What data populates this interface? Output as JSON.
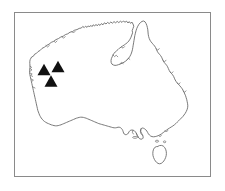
{
  "figure": {
    "kind": "distribution-map",
    "region_label": "Australia",
    "background_color": "#ffffff"
  },
  "frame": {
    "name": "map-border",
    "x": 14,
    "y": 12,
    "width": 196,
    "height": 164,
    "stroke_color": "#8a8a8a",
    "stroke_width": 1
  },
  "coastline": {
    "name": "australia-mainland-outline",
    "stroke_color": "#6b6b6b",
    "stroke_width": 0.9,
    "fill_color": "#ffffff"
  },
  "islands": [
    {
      "name": "tasmania",
      "stroke_color": "#6b6b6b",
      "stroke_width": 0.9,
      "fill_color": "#ffffff"
    }
  ],
  "markers": {
    "shape": "triangle",
    "fill_color": "#111111",
    "count": 3,
    "points": [
      {
        "label": "marker-1",
        "cx": 44.0,
        "cy": 69.5,
        "size": 13
      },
      {
        "label": "marker-2",
        "cx": 58.0,
        "cy": 66.5,
        "size": 13
      },
      {
        "label": "marker-3",
        "cx": 51.0,
        "cy": 81.0,
        "size": 13
      }
    ]
  },
  "chart_data": {
    "type": "scatter",
    "title": "",
    "xlabel": "",
    "ylabel": "",
    "x": [
      44.0,
      58.0,
      51.0
    ],
    "y": [
      69.5,
      66.5,
      81.0
    ],
    "series": [
      {
        "name": "Recorded localities",
        "marker": "triangle",
        "color": "#111111",
        "values": [
          {
            "x": 44.0,
            "y": 69.5
          },
          {
            "x": 58.0,
            "y": 66.5
          },
          {
            "x": 51.0,
            "y": 81.0
          }
        ]
      }
    ],
    "xlim": [
      14,
      210
    ],
    "ylim": [
      176,
      12
    ],
    "grid": false,
    "legend": "none",
    "annotations": []
  }
}
